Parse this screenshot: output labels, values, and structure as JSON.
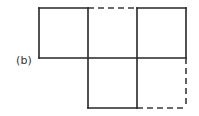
{
  "figure": {
    "label": "(b)",
    "label_name": "panel-label-b",
    "kind": "cube-net-diagram",
    "background_color": "#ffffff",
    "stroke_color_solid": "#262626",
    "stroke_color_dashed": "#3a3a3a",
    "canvas": {
      "width": 199,
      "height": 116
    },
    "grid": {
      "columns": 3,
      "rows": 2,
      "cell_width": 49,
      "cell_height": 50,
      "origin_x": 39,
      "origin_y": 8,
      "x_lines": [
        39,
        88,
        137,
        186
      ],
      "y_lines": [
        8,
        58,
        108
      ]
    },
    "faces": [
      {
        "name": "face-top-left",
        "col": 0,
        "row": 0,
        "x": 39,
        "y": 8,
        "width": 49,
        "height": 50,
        "present": true,
        "edges": {
          "top": "solid",
          "right": "solid",
          "bottom": "solid",
          "left": "solid"
        }
      },
      {
        "name": "face-top-middle",
        "col": 1,
        "row": 0,
        "x": 88,
        "y": 8,
        "width": 49,
        "height": 50,
        "present": true,
        "edges": {
          "top": "dashed",
          "right": "solid",
          "bottom": "solid",
          "left": "solid"
        }
      },
      {
        "name": "face-top-right",
        "col": 2,
        "row": 0,
        "x": 137,
        "y": 8,
        "width": 49,
        "height": 50,
        "present": true,
        "edges": {
          "top": "solid",
          "right": "solid",
          "bottom": "solid",
          "left": "solid"
        }
      },
      {
        "name": "face-bottom-left",
        "col": 0,
        "row": 1,
        "x": 39,
        "y": 58,
        "width": 49,
        "height": 50,
        "present": false,
        "edges": {
          "top": "none",
          "right": "none",
          "bottom": "none",
          "left": "none"
        }
      },
      {
        "name": "face-bottom-middle",
        "col": 1,
        "row": 1,
        "x": 88,
        "y": 58,
        "width": 49,
        "height": 50,
        "present": true,
        "edges": {
          "top": "solid",
          "right": "solid",
          "bottom": "solid",
          "left": "solid"
        }
      },
      {
        "name": "face-bottom-right",
        "col": 2,
        "row": 1,
        "x": 137,
        "y": 58,
        "width": 49,
        "height": 50,
        "present": true,
        "edges": {
          "top": "solid",
          "right": "dashed",
          "bottom": "dashed",
          "left": "solid"
        }
      }
    ],
    "segments": [
      {
        "name": "seg-top-left-top",
        "style": "solid",
        "x1": 39,
        "y1": 8,
        "x2": 88,
        "y2": 8
      },
      {
        "name": "seg-top-middle-top",
        "style": "dashed",
        "x1": 88,
        "y1": 8,
        "x2": 137,
        "y2": 8
      },
      {
        "name": "seg-top-right-top",
        "style": "solid",
        "x1": 137,
        "y1": 8,
        "x2": 186,
        "y2": 8
      },
      {
        "name": "seg-middle-horizontal",
        "style": "solid",
        "x1": 39,
        "y1": 58,
        "x2": 186,
        "y2": 58
      },
      {
        "name": "seg-bottom-middle-bottom",
        "style": "solid",
        "x1": 88,
        "y1": 108,
        "x2": 137,
        "y2": 108
      },
      {
        "name": "seg-bottom-right-bottom",
        "style": "dashed",
        "x1": 137,
        "y1": 108,
        "x2": 186,
        "y2": 108
      },
      {
        "name": "seg-left-vertical",
        "style": "solid",
        "x1": 39,
        "y1": 8,
        "x2": 39,
        "y2": 58
      },
      {
        "name": "seg-divider-1-vertical",
        "style": "solid",
        "x1": 88,
        "y1": 8,
        "x2": 88,
        "y2": 108
      },
      {
        "name": "seg-divider-2-vertical",
        "style": "solid",
        "x1": 137,
        "y1": 8,
        "x2": 137,
        "y2": 108
      },
      {
        "name": "seg-right-vertical-upper",
        "style": "solid",
        "x1": 186,
        "y1": 8,
        "x2": 186,
        "y2": 58
      },
      {
        "name": "seg-right-vertical-lower",
        "style": "dashed",
        "x1": 186,
        "y1": 58,
        "x2": 186,
        "y2": 108
      }
    ]
  }
}
